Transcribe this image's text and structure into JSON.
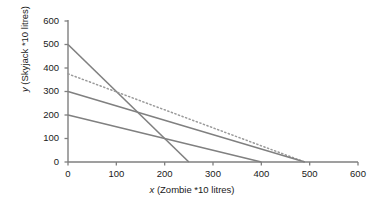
{
  "chart_data": {
    "type": "line",
    "title": "",
    "xlabel": "x (Zombie *10 litres)",
    "ylabel": "y (Skyjack *10 litres)",
    "xlim": [
      0,
      600
    ],
    "ylim": [
      0,
      600
    ],
    "xticks": [
      0,
      100,
      200,
      300,
      400,
      500,
      600
    ],
    "yticks": [
      0,
      100,
      200,
      300,
      400,
      500,
      600
    ],
    "xtick_labels": [
      "0",
      "100",
      "200",
      "300",
      "400",
      "500",
      "600"
    ],
    "ytick_labels": [
      "0",
      "100",
      "200",
      "300",
      "400",
      "500",
      "600"
    ],
    "grid": false,
    "legend": "none",
    "series": [
      {
        "name": "constraint-line-1",
        "style": "solid",
        "color": "#808080",
        "x": [
          0,
          250
        ],
        "y": [
          500,
          0
        ]
      },
      {
        "name": "objective-line-dotted",
        "style": "dotted",
        "color": "#9a9a9a",
        "x": [
          0,
          490
        ],
        "y": [
          375,
          0
        ]
      },
      {
        "name": "constraint-line-2",
        "style": "solid",
        "color": "#808080",
        "x": [
          0,
          490
        ],
        "y": [
          300,
          0
        ]
      },
      {
        "name": "constraint-line-3",
        "style": "solid",
        "color": "#808080",
        "x": [
          0,
          400
        ],
        "y": [
          200,
          0
        ]
      }
    ]
  },
  "axis": {
    "x_title": "x (Zombie *10 litres)",
    "x_var": "x",
    "x_rest": " (Zombie *10 litres)",
    "y_title": "y (Skyjack *10 litres)",
    "y_var": "y",
    "y_rest": " (Skyjack *10 litres)"
  },
  "colors": {
    "axis": "#7f7f7f",
    "line": "#808080",
    "dotted": "#9a9a9a",
    "text": "#1a1a1a",
    "background": "#ffffff"
  }
}
